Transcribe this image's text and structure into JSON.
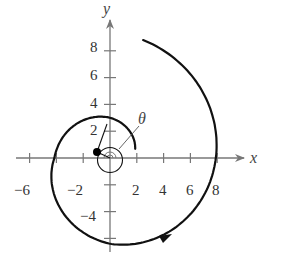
{
  "diagram": {
    "axes": {
      "x_label": "x",
      "y_label": "y",
      "x_ticks": [
        -6,
        -4,
        -2,
        2,
        4,
        6,
        8
      ],
      "x_tick_labels": [
        "−6",
        "−2",
        "2",
        "4",
        "6",
        "8"
      ],
      "y_ticks": [
        8,
        6,
        4,
        2,
        -2,
        -4,
        -6
      ],
      "y_tick_labels": [
        "8",
        "6",
        "4",
        "2",
        "−4"
      ]
    },
    "angle_label": "θ",
    "colors": {
      "axis": "#777777",
      "curve": "#111111",
      "text": "#333333"
    }
  }
}
